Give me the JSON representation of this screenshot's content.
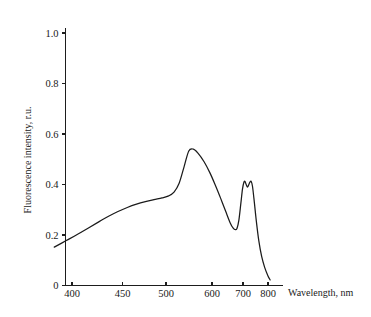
{
  "chart_data": {
    "type": "line",
    "title": "",
    "xlabel": "Wavelength, nm",
    "ylabel": "Fluorescence intensity, r.u.",
    "xticks": [
      400,
      450,
      500,
      600,
      700,
      800
    ],
    "xtick_labels": [
      "400",
      "450",
      "500",
      "600",
      "700",
      "800"
    ],
    "yticks": [
      0,
      0.2,
      0.4,
      0.6,
      0.8,
      1.0
    ],
    "ytick_labels": [
      "0",
      "0.2",
      "0.4",
      "0.6",
      "0.8",
      "1.0"
    ],
    "ylim": [
      0,
      1.05
    ],
    "xlim": [
      385,
      815
    ],
    "x_scale": "reciprocal-wavenumber",
    "grid": false,
    "legend": false,
    "series": [
      {
        "name": "Fluorescence emission spectrum",
        "color": "#1b1b1b",
        "x": [
          385,
          395,
          405,
          415,
          425,
          435,
          445,
          455,
          465,
          475,
          485,
          495,
          505,
          515,
          525,
          535,
          545,
          555,
          565,
          580,
          595,
          610,
          625,
          640,
          655,
          665,
          672,
          678,
          685,
          692,
          698,
          703,
          707,
          712,
          716,
          720,
          725,
          730,
          735,
          742,
          750,
          760,
          772,
          785,
          800,
          810
        ],
        "y": [
          0.152,
          0.178,
          0.203,
          0.228,
          0.252,
          0.274,
          0.293,
          0.309,
          0.322,
          0.332,
          0.34,
          0.347,
          0.355,
          0.37,
          0.405,
          0.47,
          0.533,
          0.54,
          0.525,
          0.49,
          0.445,
          0.395,
          0.345,
          0.295,
          0.248,
          0.227,
          0.221,
          0.226,
          0.26,
          0.325,
          0.382,
          0.408,
          0.412,
          0.398,
          0.39,
          0.397,
          0.409,
          0.412,
          0.392,
          0.33,
          0.255,
          0.178,
          0.115,
          0.072,
          0.038,
          0.022
        ]
      }
    ],
    "annotations": {
      "main_peak_nm": 548,
      "main_peak_value": 0.54,
      "shoulder_nm": 495,
      "shoulder_value": 0.35,
      "valley_nm": 673,
      "valley_value": 0.22,
      "secondary_peak1_nm": 706,
      "secondary_peak1_value": 0.412,
      "secondary_peak2_nm": 730,
      "secondary_peak2_value": 0.412
    }
  }
}
